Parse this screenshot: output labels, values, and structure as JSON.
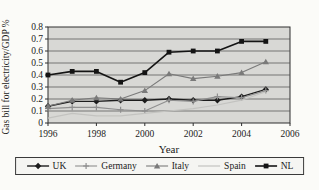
{
  "chart_data": {
    "type": "line",
    "title": "",
    "ylabel": "Gas bill for electricity/GDP %",
    "xlabel": "Year",
    "xlim": [
      1996,
      2006
    ],
    "ylim": [
      0,
      0.8
    ],
    "x": [
      1996,
      1997,
      1998,
      1999,
      2000,
      2001,
      2002,
      2003,
      2004,
      2005
    ],
    "x_ticks": [
      "1996",
      "1998",
      "2000",
      "2002",
      "2004",
      "2006"
    ],
    "y_ticks": [
      "0",
      "0.1",
      "0.2",
      "0.3",
      "0.4",
      "0.5",
      "0.6",
      "0.7",
      "0.8"
    ],
    "grid": "horizontal",
    "legend_position": "bottom",
    "plot_bg": "#d8d8d5",
    "grid_color": "#4a4a4a",
    "frame_color": "#2e2e2e",
    "series": [
      {
        "name": "UK",
        "color": "#1c1c1c",
        "marker": "diamond",
        "line_width": 1.4,
        "values": [
          0.14,
          0.18,
          0.18,
          0.19,
          0.19,
          0.2,
          0.19,
          0.19,
          0.22,
          0.28
        ]
      },
      {
        "name": "Germany",
        "color": "#8f8f8f",
        "marker": "plus",
        "line_width": 1.1,
        "values": [
          0.12,
          0.13,
          0.13,
          0.11,
          0.1,
          0.19,
          0.18,
          0.22,
          0.21,
          0.27
        ]
      },
      {
        "name": "Italy",
        "color": "#7a7a7a",
        "marker": "triangle",
        "line_width": 1.1,
        "values": [
          0.14,
          0.19,
          0.21,
          0.2,
          0.27,
          0.41,
          0.37,
          0.39,
          0.42,
          0.51
        ]
      },
      {
        "name": "Spain",
        "color": "#c3c3c0",
        "marker": "none",
        "line_width": 1.2,
        "values": [
          0.04,
          0.08,
          0.06,
          0.06,
          0.08,
          0.1,
          0.12,
          0.15,
          0.19,
          0.26
        ]
      },
      {
        "name": "NL",
        "color": "#141414",
        "marker": "square",
        "line_width": 1.6,
        "values": [
          0.4,
          0.43,
          0.43,
          0.34,
          0.42,
          0.59,
          0.6,
          0.6,
          0.68,
          0.68
        ]
      }
    ]
  }
}
